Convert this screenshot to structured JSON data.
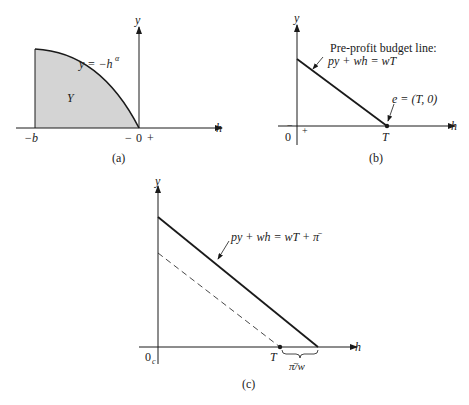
{
  "panel_a": {
    "caption": "(a)",
    "y_axis_label": "y",
    "h_axis_label": "h",
    "curve_label": "y = −h",
    "curve_exponent": "α",
    "region_label": "Y",
    "tick_neg_b": "−b",
    "tick_minus": "−",
    "tick_zero": "0",
    "tick_plus": "+",
    "fill_color": "#d4d4d4"
  },
  "panel_b": {
    "caption": "(b)",
    "y_axis_label": "y",
    "h_axis_label": "h",
    "budget_title": "Pre-profit budget line:",
    "budget_eq": "py + wh = wT",
    "endowment_label": "e = (T, 0)",
    "tick_T": "T",
    "tick_zero": "0",
    "tick_minus": "−",
    "tick_plus": "+"
  },
  "panel_c": {
    "caption": "(c)",
    "y_axis_label": "y",
    "h_axis_label": "h",
    "budget_eq": "py + wh = wT + π̄",
    "tick_origin": "0",
    "tick_origin_sub": "c",
    "tick_T": "T",
    "brace_label": "π̄/w"
  }
}
